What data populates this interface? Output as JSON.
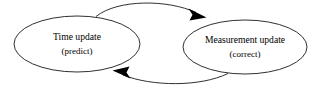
{
  "diagram": {
    "type": "cycle-diagram",
    "background_color": "#ffffff",
    "stroke_color": "#1a1a1a",
    "text_color": "#000000",
    "nodes": [
      {
        "id": "time-update",
        "shape": "ellipse",
        "label_main": "Time update",
        "label_sub": "(predict)",
        "cx": 77,
        "cy": 44,
        "rx": 63,
        "ry": 28
      },
      {
        "id": "measurement-update",
        "shape": "ellipse",
        "label_main": "Measurement update",
        "label_sub": "(correct)",
        "cx": 245,
        "cy": 47,
        "rx": 62,
        "ry": 27
      }
    ],
    "edges": [
      {
        "id": "predict-to-correct",
        "from": "time-update",
        "to": "measurement-update",
        "direction": "right",
        "arrow": "filled-triangle",
        "position": "top"
      },
      {
        "id": "correct-to-predict",
        "from": "measurement-update",
        "to": "time-update",
        "direction": "left",
        "arrow": "filled-triangle",
        "position": "bottom"
      }
    ]
  }
}
